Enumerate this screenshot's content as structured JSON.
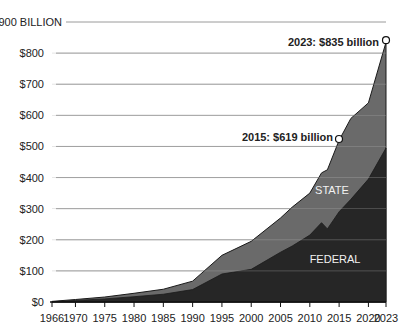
{
  "chart_data": {
    "type": "area",
    "stacked": true,
    "title": "",
    "xlabel": "",
    "ylabel": "",
    "y_unit_label": "$900 BILLION",
    "ylim": [
      0,
      900
    ],
    "xlim": [
      1966,
      2023
    ],
    "grid": true,
    "y_ticks": [
      {
        "value": 900,
        "label": "$900 BILLION"
      },
      {
        "value": 800,
        "label": "$800"
      },
      {
        "value": 700,
        "label": "$700"
      },
      {
        "value": 600,
        "label": "$600"
      },
      {
        "value": 500,
        "label": "$500"
      },
      {
        "value": 400,
        "label": "$400"
      },
      {
        "value": 300,
        "label": "$300"
      },
      {
        "value": 200,
        "label": "$200"
      },
      {
        "value": 100,
        "label": "$100"
      },
      {
        "value": 0,
        "label": "$0"
      }
    ],
    "x_ticks": [
      1966,
      1970,
      1975,
      1980,
      1985,
      1990,
      1995,
      2000,
      2005,
      2010,
      2015,
      2020,
      2023
    ],
    "x": [
      1966,
      1970,
      1975,
      1980,
      1985,
      1990,
      1995,
      2000,
      2005,
      2007,
      2010,
      2012,
      2013,
      2015,
      2017,
      2020,
      2023
    ],
    "series": [
      {
        "name": "FEDERAL",
        "color": "#262626",
        "values": [
          1,
          5,
          10,
          17,
          25,
          40,
          90,
          105,
          160,
          180,
          215,
          255,
          235,
          290,
          330,
          395,
          495
        ]
      },
      {
        "name": "STATE",
        "color": "#6a6a6a",
        "values": [
          1,
          3,
          6,
          11,
          16,
          27,
          60,
          90,
          110,
          125,
          135,
          160,
          190,
          230,
          260,
          245,
          340
        ]
      }
    ],
    "totals": [
      2,
      8,
      16,
      28,
      41,
      67,
      150,
      195,
      270,
      305,
      350,
      415,
      425,
      520,
      590,
      640,
      835
    ],
    "annotations": [
      {
        "text": "2015: $619 billion",
        "year": 2015,
        "value": 619
      },
      {
        "text": "2023: $835 billion",
        "year": 2023,
        "value": 835
      }
    ],
    "area_labels": [
      {
        "text": "STATE",
        "series": "STATE"
      },
      {
        "text": "FEDERAL",
        "series": "FEDERAL"
      }
    ],
    "legend": "none (inline area labels)"
  }
}
